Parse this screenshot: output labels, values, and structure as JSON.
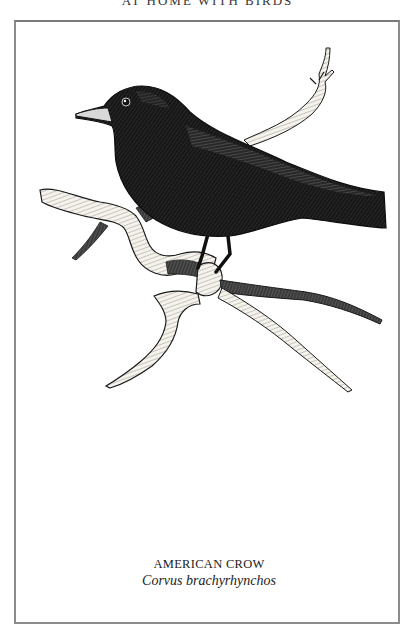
{
  "page": {
    "running_head": "AT HOME WITH BIRDS"
  },
  "plate": {
    "illustration": {
      "subject": "crow-perched-on-branch",
      "style": "pen-and-ink crosshatch",
      "ink_color": "#111111",
      "branch_fill": "#f4f1ea"
    },
    "caption": {
      "common_name": "AMERICAN CROW",
      "scientific_name": "Corvus brachyrhynchos"
    },
    "frame_color": "#8c8c8c"
  }
}
